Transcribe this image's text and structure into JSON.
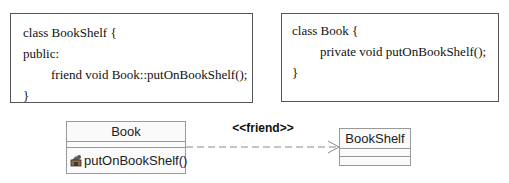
{
  "code_snippets": [
    {
      "id": "bookshelf-code",
      "lines": [
        {
          "indent": 0,
          "text": "class BookShelf {"
        },
        {
          "indent": 0,
          "text": "public:"
        },
        {
          "indent": 1,
          "text": "friend void Book::putOnBookShelf();"
        },
        {
          "indent": 0,
          "text": "}"
        }
      ]
    },
    {
      "id": "book-code",
      "lines": [
        {
          "indent": 0,
          "text": "class Book {"
        },
        {
          "indent": 1,
          "text": "private void putOnBookShelf();"
        },
        {
          "indent": 0,
          "text": "}"
        }
      ]
    }
  ],
  "uml": {
    "classes": [
      {
        "name": "Book",
        "attributes": [],
        "operations": [
          {
            "visibility_icon": "private-lock-icon",
            "text": "putOnBookShelf()"
          }
        ]
      },
      {
        "name": "BookShelf",
        "attributes": [],
        "operations": []
      }
    ],
    "dependency": {
      "from": "Book",
      "to": "BookShelf",
      "stereotype": "<<friend>>",
      "line_style": "dashed",
      "arrow": "open"
    }
  },
  "colors": {
    "box_border": "#555555",
    "uml_border": "#9a9a9a",
    "uml_fill": "#fafafa",
    "edge": "#8a8a8a"
  }
}
